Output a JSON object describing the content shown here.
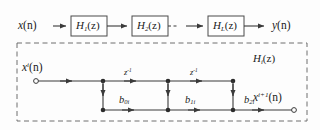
{
  "figure": {
    "colors": {
      "line": "#3a3a3a",
      "text": "#1b1b1b",
      "dashed_border": "#6e6e6e",
      "block_border": "#4a4a4a",
      "background": "#fdfdfd"
    }
  },
  "cascade": {
    "input_label": {
      "var": "x",
      "arg": "(n)"
    },
    "output_label": {
      "var": "y",
      "arg": "(n)"
    },
    "blocks": [
      {
        "name": "H",
        "sub": "1",
        "arg": "(z)"
      },
      {
        "name": "H",
        "sub": "2",
        "arg": "(z)"
      },
      {
        "name": "H",
        "sub": "L",
        "arg": "(z)"
      }
    ],
    "ellipsis": "· · ·"
  },
  "section": {
    "box_label": {
      "name": "H",
      "sub": "i",
      "arg": "(z)"
    },
    "input_label": {
      "var": "x",
      "sup": "i",
      "arg": "(n)"
    },
    "output_label": {
      "var": "x",
      "sup": "i+1",
      "arg": "(n)"
    },
    "delays": [
      {
        "label": "z",
        "exp": "-1"
      },
      {
        "label": "z",
        "exp": "-1"
      }
    ],
    "coefficients": [
      {
        "name": "b",
        "sub": "0i"
      },
      {
        "name": "b",
        "sub": "1i"
      },
      {
        "name": "b",
        "sub": "2i"
      }
    ]
  }
}
